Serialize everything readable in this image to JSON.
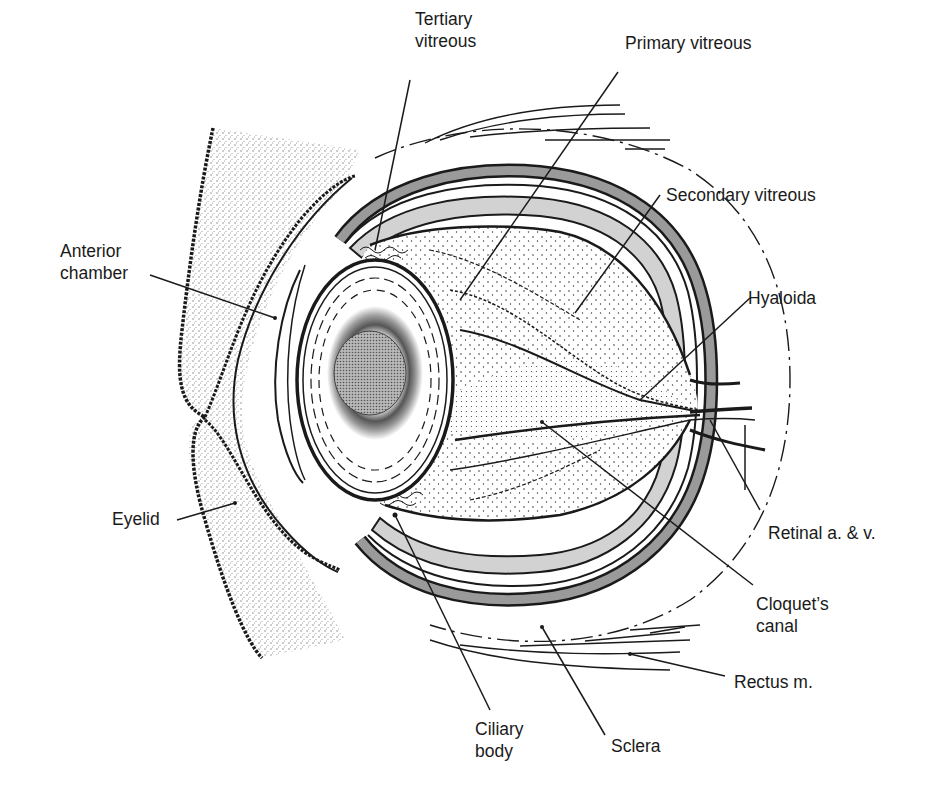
{
  "figure": {
    "colors": {
      "ink": "#1a1a1a",
      "sclera_band": "#9a9a9a",
      "choroid_fill": "#d2d2d2",
      "lid_stipple": "#bdbdbd",
      "lens_nucleus": "#a8a8a8",
      "background": "#ffffff"
    }
  },
  "labels": [
    {
      "id": "tertiary-vitreous",
      "text": "Tertiary\nvitreous",
      "x": 415,
      "y": 8
    },
    {
      "id": "primary-vitreous",
      "text": "Primary vitreous",
      "x": 625,
      "y": 32
    },
    {
      "id": "secondary-vitreous",
      "text": "Secondary vitreous",
      "x": 666,
      "y": 184
    },
    {
      "id": "anterior-chamber",
      "text": "Anterior\nchamber",
      "x": 60,
      "y": 240
    },
    {
      "id": "hyaloida",
      "text": "Hyaloida",
      "x": 748,
      "y": 287
    },
    {
      "id": "eyelid",
      "text": "Eyelid",
      "x": 112,
      "y": 508
    },
    {
      "id": "retinal-vessels",
      "text": "Retinal a. & v.",
      "x": 768,
      "y": 522
    },
    {
      "id": "cloquets-canal",
      "text": "Cloquet’s\ncanal",
      "x": 756,
      "y": 593
    },
    {
      "id": "rectus-muscle",
      "text": "Rectus m.",
      "x": 734,
      "y": 671
    },
    {
      "id": "ciliary-body",
      "text": "Ciliary\nbody",
      "x": 475,
      "y": 718
    },
    {
      "id": "sclera",
      "text": "Sclera",
      "x": 611,
      "y": 735
    }
  ]
}
